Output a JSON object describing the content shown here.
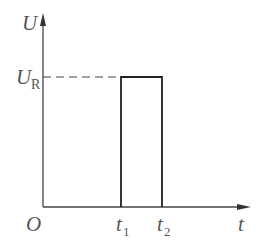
{
  "diagram": {
    "type": "rectangular-pulse-voltage-time-graph",
    "axes": {
      "y_label": "U",
      "x_label": "t",
      "origin_label": "O"
    },
    "levels": {
      "pulse_level_label_main": "U",
      "pulse_level_label_sub": "R"
    },
    "ticks": {
      "t1_main": "t",
      "t1_sub": "1",
      "t2_main": "t",
      "t2_sub": "2"
    },
    "colors": {
      "line": "#333333",
      "text": "#555555",
      "background": "#ffffff"
    }
  }
}
